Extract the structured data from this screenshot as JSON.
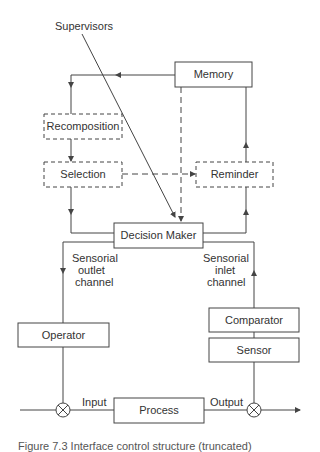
{
  "diagram": {
    "title_label": "Supervisors",
    "nodes": {
      "memory": {
        "label": "Memory",
        "style": "solid"
      },
      "recomposition": {
        "label": "Recomposition",
        "style": "dashed"
      },
      "selection": {
        "label": "Selection",
        "style": "dashed"
      },
      "reminder": {
        "label": "Reminder",
        "style": "dashed"
      },
      "decision_maker": {
        "label": "Decision Maker",
        "style": "solid"
      },
      "operator": {
        "label": "Operator",
        "style": "solid"
      },
      "comparator": {
        "label": "Comparator",
        "style": "solid"
      },
      "sensor": {
        "label": "Sensor",
        "style": "solid"
      },
      "process": {
        "label": "Process",
        "style": "solid"
      }
    },
    "channel_labels": {
      "outlet": [
        "Sensorial",
        "outlet",
        "channel"
      ],
      "inlet": [
        "Sensorial",
        "inlet",
        "channel"
      ]
    },
    "signal_labels": {
      "input": "Input",
      "output": "Output"
    },
    "edges": [
      {
        "from": "memory",
        "to": "recomposition",
        "style": "solid"
      },
      {
        "from": "recomposition",
        "to": "selection",
        "style": "solid"
      },
      {
        "from": "selection",
        "to": "decision_maker",
        "style": "solid"
      },
      {
        "from": "selection",
        "to": "reminder",
        "style": "dashed"
      },
      {
        "from": "memory",
        "to": "decision_maker",
        "style": "dashed"
      },
      {
        "from": "supervisors",
        "to": "decision_maker",
        "style": "solid"
      },
      {
        "from": "decision_maker",
        "to": "reminder",
        "style": "solid"
      },
      {
        "from": "reminder",
        "to": "memory",
        "style": "solid"
      },
      {
        "from": "decision_maker",
        "to": "operator",
        "style": "solid",
        "label": "Sensorial outlet channel"
      },
      {
        "from": "comparator",
        "to": "decision_maker",
        "style": "solid",
        "label": "Sensorial inlet channel"
      },
      {
        "from": "sensor",
        "to": "comparator",
        "style": "solid"
      },
      {
        "from": "operator",
        "to": "input_junction",
        "style": "solid"
      },
      {
        "from": "input_junction",
        "to": "process",
        "style": "solid",
        "label": "Input"
      },
      {
        "from": "process",
        "to": "output_junction",
        "style": "solid",
        "label": "Output"
      },
      {
        "from": "output_junction",
        "to": "sensor",
        "style": "solid"
      }
    ],
    "junctions": [
      "input_junction",
      "output_junction"
    ],
    "caption": "Figure 7.3 Interface control structure (truncated)"
  },
  "colors": {
    "stroke": "#444444",
    "text": "#333333",
    "background": "#ffffff"
  }
}
